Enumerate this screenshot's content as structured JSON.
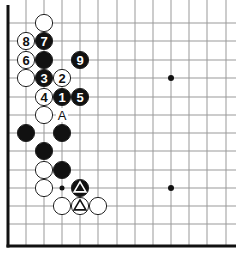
{
  "diagram": {
    "type": "go-board-fragment",
    "grid": {
      "columns_x": [
        8,
        26,
        44,
        62,
        80,
        98,
        117,
        135,
        153,
        171,
        189,
        207,
        226
      ],
      "rows_y": [
        23,
        41,
        60,
        78,
        97,
        115,
        133,
        151,
        170,
        188,
        206,
        224
      ],
      "left_edge_x": 8,
      "bottom_edge_y": 246,
      "line_color": "#999999",
      "edge_color": "#111111"
    },
    "star_points": [
      {
        "col": 9,
        "row": 3
      },
      {
        "col": 9,
        "row": 9
      }
    ],
    "small_marks": [
      {
        "col": 3,
        "row": 9,
        "type": "dot"
      }
    ],
    "stones": [
      {
        "color": "white",
        "col": 2,
        "row": 0,
        "label": ""
      },
      {
        "color": "white",
        "col": 1,
        "row": 1,
        "label": "8"
      },
      {
        "color": "black",
        "col": 2,
        "row": 1,
        "label": "7"
      },
      {
        "color": "white",
        "col": 1,
        "row": 2,
        "label": "6"
      },
      {
        "color": "black",
        "col": 2,
        "row": 2,
        "label": ""
      },
      {
        "color": "black",
        "col": 4,
        "row": 2,
        "label": "9"
      },
      {
        "color": "white",
        "col": 1,
        "row": 3,
        "label": ""
      },
      {
        "color": "black",
        "col": 2,
        "row": 3,
        "label": "3"
      },
      {
        "color": "white",
        "col": 3,
        "row": 3,
        "label": "2"
      },
      {
        "color": "white",
        "col": 2,
        "row": 4,
        "label": "4"
      },
      {
        "color": "black",
        "col": 3,
        "row": 4,
        "label": "1"
      },
      {
        "color": "black",
        "col": 4,
        "row": 4,
        "label": "5"
      },
      {
        "color": "white",
        "col": 2,
        "row": 5,
        "label": ""
      },
      {
        "color": "black",
        "col": 1,
        "row": 6,
        "label": ""
      },
      {
        "color": "black",
        "col": 3,
        "row": 6,
        "label": ""
      },
      {
        "color": "black",
        "col": 2,
        "row": 7,
        "label": ""
      },
      {
        "color": "white",
        "col": 2,
        "row": 8,
        "label": ""
      },
      {
        "color": "black",
        "col": 3,
        "row": 8,
        "label": ""
      },
      {
        "color": "white",
        "col": 2,
        "row": 9,
        "label": ""
      },
      {
        "color": "black",
        "col": 4,
        "row": 9,
        "label": "",
        "mark": "triangle"
      },
      {
        "color": "white",
        "col": 3,
        "row": 10,
        "label": ""
      },
      {
        "color": "white",
        "col": 4,
        "row": 10,
        "label": "",
        "mark": "triangle"
      },
      {
        "color": "white",
        "col": 5,
        "row": 10,
        "label": ""
      }
    ],
    "letter_marks": [
      {
        "col": 3,
        "row": 5,
        "label": "A"
      }
    ]
  }
}
